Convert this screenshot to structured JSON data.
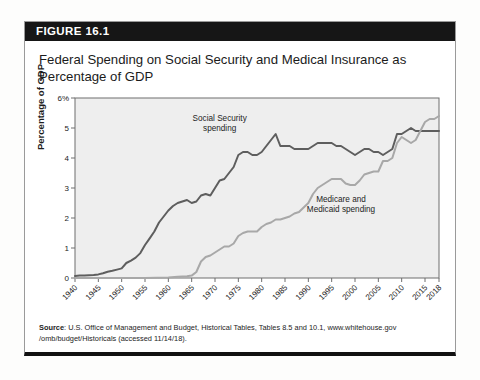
{
  "figure": {
    "number_label": "FIGURE 16.1",
    "title": "Federal Spending on Social Security and Medical Insurance as Percentage of GDP",
    "source_prefix": "Source",
    "source_line1": ": U.S. Office of Management and Budget, Historical Tables, Tables 8.5 and 10.1, www.whitehouse.gov",
    "source_line2": "/omb/budget/Historicals (accessed 11/14/18)."
  },
  "colors": {
    "header_bar": "#161616",
    "plot_background": "#eeeeee",
    "plot_border": "#6f6f6f",
    "social_security_line": "#5e5e5e",
    "medicare_line": "#a8a8a8",
    "text": "#1d1d1d",
    "card_bottom_rule": "#111111"
  },
  "chart_data": {
    "type": "line",
    "title": "Federal Spending on Social Security and Medical Insurance as Percentage of GDP",
    "xlabel": "",
    "ylabel": "Percentage of GDP",
    "xlim": [
      1940,
      2018
    ],
    "ylim": [
      0,
      6
    ],
    "grid": false,
    "legend_position": "inline-annotations",
    "ytick_labels": [
      "0",
      "1",
      "2",
      "3",
      "4",
      "5",
      "6%"
    ],
    "ytick_values": [
      0,
      1,
      2,
      3,
      4,
      5,
      6
    ],
    "xtick_labels": [
      "1940",
      "1945",
      "1950",
      "1955",
      "1960",
      "1965",
      "1970",
      "1975",
      "1980",
      "1985",
      "1990",
      "1995",
      "2000",
      "2005",
      "2010",
      "2015",
      "2018"
    ],
    "xtick_values": [
      1940,
      1945,
      1950,
      1955,
      1960,
      1965,
      1970,
      1975,
      1980,
      1985,
      1990,
      1995,
      2000,
      2005,
      2010,
      2015,
      2018
    ],
    "annotations": [
      {
        "text_line1": "Social Security",
        "text_line2": "spending",
        "x": 1971,
        "y": 5.25
      },
      {
        "text_line1": "Medicare and",
        "text_line2": "Medicaid spending",
        "x": 1997,
        "y": 2.55
      }
    ],
    "series": [
      {
        "name": "Social Security spending",
        "color": "#5e5e5e",
        "x": [
          1940,
          1941,
          1942,
          1943,
          1944,
          1945,
          1946,
          1947,
          1948,
          1949,
          1950,
          1951,
          1952,
          1953,
          1954,
          1955,
          1956,
          1957,
          1958,
          1959,
          1960,
          1961,
          1962,
          1963,
          1964,
          1965,
          1966,
          1967,
          1968,
          1969,
          1970,
          1971,
          1972,
          1973,
          1974,
          1975,
          1976,
          1977,
          1978,
          1979,
          1980,
          1981,
          1982,
          1983,
          1984,
          1985,
          1986,
          1987,
          1988,
          1989,
          1990,
          1991,
          1992,
          1993,
          1994,
          1995,
          1996,
          1997,
          1998,
          1999,
          2000,
          2001,
          2002,
          2003,
          2004,
          2005,
          2006,
          2007,
          2008,
          2009,
          2010,
          2011,
          2012,
          2013,
          2014,
          2015,
          2016,
          2017,
          2018
        ],
        "values": [
          0.07,
          0.08,
          0.08,
          0.09,
          0.1,
          0.12,
          0.16,
          0.21,
          0.24,
          0.28,
          0.32,
          0.5,
          0.58,
          0.68,
          0.83,
          1.1,
          1.32,
          1.55,
          1.85,
          2.05,
          2.25,
          2.4,
          2.5,
          2.55,
          2.6,
          2.5,
          2.55,
          2.75,
          2.8,
          2.75,
          3.0,
          3.25,
          3.3,
          3.5,
          3.7,
          4.1,
          4.2,
          4.2,
          4.1,
          4.1,
          4.2,
          4.4,
          4.6,
          4.8,
          4.4,
          4.4,
          4.4,
          4.3,
          4.3,
          4.3,
          4.3,
          4.4,
          4.5,
          4.5,
          4.5,
          4.5,
          4.4,
          4.4,
          4.3,
          4.2,
          4.1,
          4.2,
          4.3,
          4.3,
          4.2,
          4.2,
          4.1,
          4.2,
          4.3,
          4.8,
          4.8,
          4.9,
          5.0,
          4.9,
          4.9,
          4.9,
          4.9,
          4.9,
          4.9
        ]
      },
      {
        "name": "Medicare and Medicaid spending",
        "color": "#a8a8a8",
        "x": [
          1940,
          1945,
          1950,
          1955,
          1960,
          1962,
          1964,
          1965,
          1966,
          1967,
          1968,
          1969,
          1970,
          1971,
          1972,
          1973,
          1974,
          1975,
          1976,
          1977,
          1978,
          1979,
          1980,
          1981,
          1982,
          1983,
          1984,
          1985,
          1986,
          1987,
          1988,
          1989,
          1990,
          1991,
          1992,
          1993,
          1994,
          1995,
          1996,
          1997,
          1998,
          1999,
          2000,
          2001,
          2002,
          2003,
          2004,
          2005,
          2006,
          2007,
          2008,
          2009,
          2010,
          2011,
          2012,
          2013,
          2014,
          2015,
          2016,
          2017,
          2018
        ],
        "values": [
          0,
          0,
          0,
          0,
          0.02,
          0.04,
          0.06,
          0.08,
          0.2,
          0.55,
          0.7,
          0.75,
          0.85,
          0.95,
          1.05,
          1.05,
          1.15,
          1.4,
          1.5,
          1.55,
          1.55,
          1.55,
          1.7,
          1.8,
          1.85,
          1.95,
          1.95,
          2.0,
          2.05,
          2.15,
          2.2,
          2.35,
          2.5,
          2.8,
          3.0,
          3.1,
          3.2,
          3.3,
          3.3,
          3.3,
          3.15,
          3.1,
          3.1,
          3.25,
          3.45,
          3.5,
          3.55,
          3.55,
          3.9,
          3.9,
          4.0,
          4.5,
          4.7,
          4.6,
          4.5,
          4.6,
          4.9,
          5.2,
          5.3,
          5.3,
          5.4
        ]
      }
    ]
  }
}
